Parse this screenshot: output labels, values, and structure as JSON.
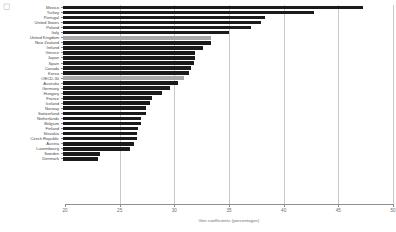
{
  "corner_mark": "◻",
  "chart_data": {
    "type": "bar",
    "orientation": "horizontal",
    "title": "",
    "xlabel": "Gini coefficients (percentages)",
    "ylabel": "",
    "xlim": [
      20,
      50
    ],
    "xticks": [
      20,
      25,
      30,
      35,
      40,
      45,
      50
    ],
    "grid": true,
    "legend": "none",
    "colors": {
      "bar": "#1b1b1b",
      "highlight": "#a8a8a8",
      "gridline": "#c9c9c9",
      "axis": "#8f8f8f",
      "label_text": "#4a4a4a",
      "tick_text": "#6d6d6d"
    },
    "categories": [
      "Mexico",
      "Turkey",
      "Portugal",
      "United States",
      "Poland",
      "Italy",
      "United Kingdom",
      "New Zealand",
      "Ireland",
      "Greece",
      "Japan",
      "Spain",
      "Canada",
      "Korea",
      "OECD-30",
      "Australia",
      "Germany",
      "Hungary",
      "France",
      "Iceland",
      "Norway",
      "Switzerland",
      "Netherlands",
      "Belgium",
      "Finland",
      "Slovakia",
      "Czech Republic",
      "Austria",
      "Luxembourg",
      "Sweden",
      "Denmark"
    ],
    "values": [
      47.4,
      43.0,
      38.5,
      38.1,
      37.2,
      35.2,
      33.5,
      33.5,
      32.8,
      32.1,
      32.1,
      32.0,
      31.7,
      31.5,
      31.1,
      30.5,
      29.8,
      29.1,
      28.1,
      28.0,
      27.6,
      27.6,
      27.1,
      27.1,
      26.9,
      26.8,
      26.8,
      26.5,
      26.1,
      23.4,
      23.2
    ],
    "highlighted": [
      "United Kingdom",
      "OECD-30"
    ]
  }
}
